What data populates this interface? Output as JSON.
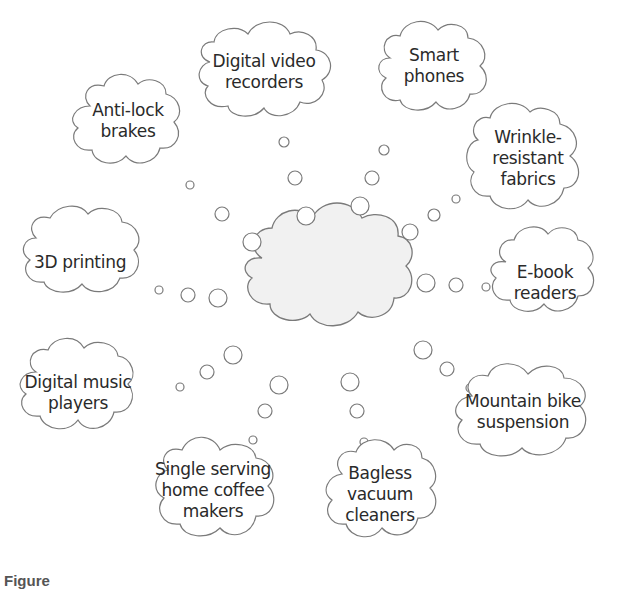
{
  "diagram": {
    "type": "brainstorm cloud diagram",
    "center": {
      "label": ""
    },
    "ideas": [
      {
        "id": "digital-video-recorders",
        "lines": [
          "Digital video",
          "recorders"
        ]
      },
      {
        "id": "smart-phones",
        "lines": [
          "Smart",
          "phones"
        ]
      },
      {
        "id": "wrinkle-resistant-fabrics",
        "lines": [
          "Wrinkle-",
          "resistant",
          "fabrics"
        ]
      },
      {
        "id": "e-book-readers",
        "lines": [
          "E-book",
          "readers"
        ]
      },
      {
        "id": "mountain-bike-suspension",
        "lines": [
          "Mountain bike",
          "suspension"
        ]
      },
      {
        "id": "bagless-vacuum-cleaners",
        "lines": [
          "Bagless",
          "vacuum",
          "cleaners"
        ]
      },
      {
        "id": "single-serving-coffee-makers",
        "lines": [
          "Single serving",
          "home coffee",
          "makers"
        ]
      },
      {
        "id": "digital-music-players",
        "lines": [
          "Digital music",
          "players"
        ]
      },
      {
        "id": "3d-printing",
        "lines": [
          "3D printing"
        ]
      },
      {
        "id": "anti-lock-brakes",
        "lines": [
          "Anti-lock",
          "brakes"
        ]
      }
    ],
    "caption": "Figure"
  },
  "colors": {
    "stroke": "#7a7a7a",
    "center_fill": "#f1f1f1",
    "text": "#2a2a2a"
  }
}
